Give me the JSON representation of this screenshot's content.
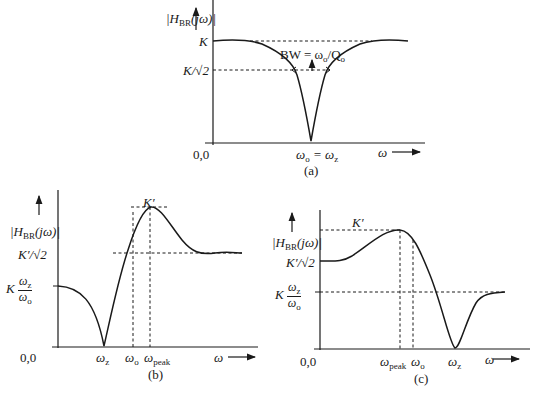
{
  "figure_a": {
    "caption": "(a)",
    "y_label_main": "|H",
    "y_label_sub": "BR",
    "y_label_tail": "(jω)|",
    "tick_K": "K",
    "tick_K_sqrt2": "K/√2",
    "bandwidth_label": "BW = ω",
    "bandwidth_sub_o": "o",
    "bandwidth_tail": "/Q",
    "bandwidth_sub_o2": "o",
    "origin": "0,0",
    "x_mark": "ω",
    "x_mark_sub": "o",
    "x_mark_eq": " = ω",
    "x_mark_sub2": "z",
    "x_axis_label": "ω"
  },
  "figure_b": {
    "caption": "(b)",
    "y_label_main": "|H",
    "y_label_sub": "BR",
    "y_label_tail": "(jω)|",
    "tick_Kprime": "K′",
    "tick_Kprime_sqrt2": "K′/√2",
    "tick_low_K": "K",
    "tick_low_num": "ω",
    "tick_low_num_sub": "z",
    "tick_low_den": "ω",
    "tick_low_den_sub": "o",
    "origin": "0,0",
    "x_marks": [
      {
        "main": "ω",
        "sub": "z"
      },
      {
        "main": "ω",
        "sub": "o"
      },
      {
        "main": "ω",
        "sub": "peak"
      }
    ],
    "x_axis_label": "ω"
  },
  "figure_c": {
    "caption": "(c)",
    "y_label_main": "|H",
    "y_label_sub": "BR",
    "y_label_tail": "(jω)|",
    "tick_Kprime": "K′",
    "tick_Kprime_sqrt2": "K′/√2",
    "tick_low_K": "K",
    "tick_low_num": "ω",
    "tick_low_num_sub": "z",
    "tick_low_den": "ω",
    "tick_low_den_sub": "o",
    "origin": "0,0",
    "x_marks": [
      {
        "main": "ω",
        "sub": "peak"
      },
      {
        "main": "ω",
        "sub": "o"
      },
      {
        "main": "ω",
        "sub": "z"
      }
    ],
    "x_axis_label": "ω"
  }
}
